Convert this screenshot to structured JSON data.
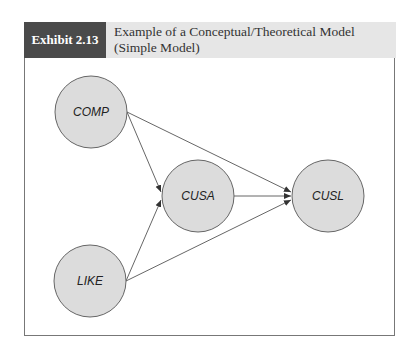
{
  "header": {
    "exhibit_label": "Exhibit 2.13",
    "title_line1": "Example of a Conceptual/Theoretical Model",
    "title_line2": "(Simple Model)"
  },
  "diagram": {
    "nodes": [
      {
        "id": "COMP",
        "label": "COMP"
      },
      {
        "id": "CUSA",
        "label": "CUSA"
      },
      {
        "id": "CUSL",
        "label": "CUSL"
      },
      {
        "id": "LIKE",
        "label": "LIKE"
      }
    ],
    "edges": [
      {
        "from": "COMP",
        "to": "CUSA"
      },
      {
        "from": "COMP",
        "to": "CUSL"
      },
      {
        "from": "LIKE",
        "to": "CUSA"
      },
      {
        "from": "LIKE",
        "to": "CUSL"
      },
      {
        "from": "CUSA",
        "to": "CUSL"
      }
    ],
    "colors": {
      "node_fill": "#dcdcdc",
      "node_stroke": "#666666",
      "edge": "#555555"
    }
  }
}
